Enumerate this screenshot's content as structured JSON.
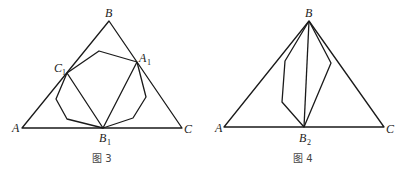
{
  "figures": [
    {
      "caption": "图 3",
      "labels": {
        "A": "A",
        "B": "B",
        "C": "C",
        "A1": "A",
        "A1_sub": "1",
        "B1": "B",
        "B1_sub": "1",
        "C1": "C",
        "C1_sub": "1"
      }
    },
    {
      "caption": "图 4",
      "labels": {
        "A": "A",
        "B": "B",
        "C": "C",
        "B2": "B",
        "B2_sub": "2"
      }
    }
  ],
  "colors": {
    "line": "#1a1a1a",
    "text": "#222222"
  }
}
